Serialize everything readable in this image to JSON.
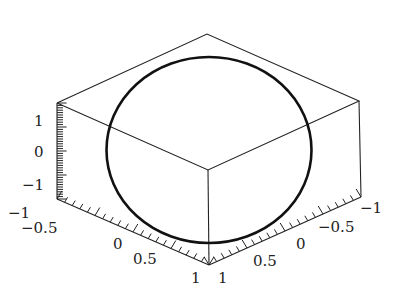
{
  "chart_data": {
    "type": "line",
    "subtype": "3d-parametric-curve",
    "title": "",
    "series": [
      {
        "name": "circle",
        "shape": "circle",
        "radius": 1,
        "center": [
          0,
          0,
          0
        ],
        "color": "#111111"
      }
    ],
    "axes": {
      "vertical": {
        "range": [
          -1,
          1
        ],
        "ticks": [
          "1",
          "0",
          "−1"
        ]
      },
      "front_left": {
        "range": [
          -1,
          1
        ],
        "ticks": [
          "−1",
          "−0.5",
          "0",
          "0.5",
          "1"
        ]
      },
      "front_right": {
        "range": [
          -1,
          1
        ],
        "ticks": [
          "1",
          "0.5",
          "0",
          "−0.5",
          "−1"
        ]
      }
    },
    "box": true,
    "grid": false,
    "legend": null
  },
  "labels": {
    "vertical": [
      {
        "text": "1",
        "x": 34,
        "y": 126
      },
      {
        "text": "0",
        "x": 34,
        "y": 157
      },
      {
        "text": "−1",
        "x": 22,
        "y": 190
      }
    ],
    "front_left": [
      {
        "text": "−1",
        "x": 8,
        "y": 218
      },
      {
        "text": "−0.5",
        "x": 21,
        "y": 233
      },
      {
        "text": "0",
        "x": 113,
        "y": 249
      },
      {
        "text": "0.5",
        "x": 133,
        "y": 264
      },
      {
        "text": "1",
        "x": 191,
        "y": 283
      }
    ],
    "front_right": [
      {
        "text": "1",
        "x": 218,
        "y": 283
      },
      {
        "text": "0.5",
        "x": 253,
        "y": 266
      },
      {
        "text": "0",
        "x": 296,
        "y": 249
      },
      {
        "text": "−0.5",
        "x": 318,
        "y": 232
      },
      {
        "text": "−1",
        "x": 360,
        "y": 213
      }
    ]
  }
}
